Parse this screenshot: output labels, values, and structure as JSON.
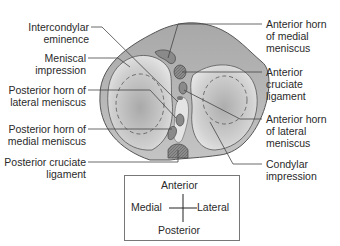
{
  "figure": {
    "labels_left": [
      {
        "id": "intercondylar-eminence",
        "lines": [
          "Intercondylar",
          "eminence"
        ]
      },
      {
        "id": "meniscal-impression",
        "lines": [
          "Meniscal",
          "impression"
        ]
      },
      {
        "id": "posterior-horn-lateral-meniscus",
        "lines": [
          "Posterior horn of",
          "lateral meniscus"
        ]
      },
      {
        "id": "posterior-horn-medial-meniscus",
        "lines": [
          "Posterior horn of",
          "medial meniscus"
        ]
      },
      {
        "id": "posterior-cruciate-ligament",
        "lines": [
          "Posterior cruciate",
          "ligament"
        ]
      }
    ],
    "labels_right": [
      {
        "id": "anterior-horn-medial-meniscus",
        "lines": [
          "Anterior horn",
          "of medial",
          "meniscus"
        ]
      },
      {
        "id": "anterior-cruciate-ligament",
        "lines": [
          "Anterior",
          "cruciate",
          "ligament"
        ]
      },
      {
        "id": "anterior-horn-lateral-meniscus",
        "lines": [
          "Anterior horn",
          "of lateral",
          "meniscus"
        ]
      },
      {
        "id": "condylar-impression",
        "lines": [
          "Condylar",
          "impression"
        ]
      }
    ],
    "orientation": {
      "top": "Anterior",
      "left": "Medial",
      "right": "Lateral",
      "bottom": "Posterior"
    },
    "colors": {
      "bone_fill": "#bdbdbd",
      "bone_outline": "#555555",
      "condyle_fill": "#d6d6d6",
      "ligament_fill": "#8a8a8a",
      "leader_line": "#444444"
    }
  }
}
